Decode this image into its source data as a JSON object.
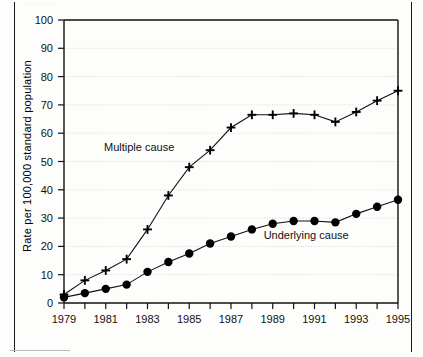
{
  "figure": {
    "cropped_header_fragment": "···· ····",
    "y_axis_title": "Rate per 100,000 standard population"
  },
  "chart_data": {
    "type": "line",
    "title": "",
    "subtitle": "",
    "xlabel": "",
    "ylabel": "Rate per 100,000 standard population",
    "xlim": [
      1979,
      1995
    ],
    "ylim": [
      0,
      100
    ],
    "ytick_step": 10,
    "yticks": [
      0,
      10,
      20,
      30,
      40,
      50,
      60,
      70,
      80,
      90,
      100
    ],
    "xticks": [
      1979,
      1980,
      1981,
      1982,
      1983,
      1984,
      1985,
      1986,
      1987,
      1988,
      1989,
      1990,
      1991,
      1992,
      1993,
      1994,
      1995
    ],
    "xtick_labels": [
      "1979",
      "",
      "1981",
      "",
      "1983",
      "",
      "1985",
      "",
      "1987",
      "",
      "1989",
      "",
      "1991",
      "",
      "1993",
      "",
      "1995"
    ],
    "grid": true,
    "grid_axis": "y",
    "legend": "inline-annotations",
    "x": [
      1979,
      1980,
      1981,
      1982,
      1983,
      1984,
      1985,
      1986,
      1987,
      1988,
      1989,
      1990,
      1991,
      1992,
      1993,
      1994,
      1995
    ],
    "series": [
      {
        "name": "Multiple cause",
        "marker": "plus",
        "label_x": 1982.6,
        "label_y": 55,
        "values": [
          3,
          8,
          11.5,
          15.5,
          26,
          38,
          48,
          54,
          62,
          66.5,
          66.5,
          67,
          66.5,
          64,
          67.5,
          71.5,
          75
        ]
      },
      {
        "name": "Underlying cause",
        "marker": "circle",
        "label_x": 1990.6,
        "label_y": 24,
        "values": [
          2,
          3.5,
          5,
          6.5,
          11,
          14.5,
          17.5,
          21,
          23.5,
          26,
          28,
          29,
          29,
          28.5,
          31.5,
          34,
          36.5
        ]
      }
    ],
    "annotations": [
      {
        "text": "Multiple cause",
        "x": 1982.6,
        "y": 55
      },
      {
        "text": "Underlying cause",
        "x": 1990.6,
        "y": 24
      }
    ],
    "colors": {
      "line": "#111111",
      "marker": "#000000",
      "grid": "#cfcfcf",
      "axis": "#111111",
      "background": "#fdfdfc"
    }
  }
}
